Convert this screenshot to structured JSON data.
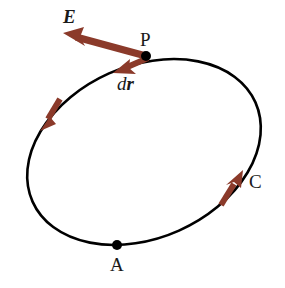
{
  "figure": {
    "type": "physics-line-integral-diagram",
    "background_color": "#ffffff",
    "curve": {
      "name": "closed-loop-path",
      "shape": "ellipse",
      "stroke_color": "#000000",
      "stroke_width": 2.6,
      "center_x": 144,
      "center_y": 152,
      "radius_x": 122,
      "radius_y": 86,
      "rotation_deg": -24
    },
    "points": [
      {
        "id": "P",
        "label": "P",
        "x": 146,
        "y": 56,
        "dot_radius": 5,
        "dot_color": "#000000",
        "label_x": 140,
        "label_y": 30
      },
      {
        "id": "A",
        "label": "A",
        "x": 117,
        "y": 245,
        "dot_radius": 5,
        "dot_color": "#000000",
        "label_x": 110,
        "label_y": 255
      }
    ],
    "vectors": [
      {
        "id": "E",
        "label": "E",
        "label_style": "bold-italic",
        "description": "electric field vector at point P",
        "color": "#8B3A2A",
        "from_x": 146,
        "from_y": 56,
        "to_x": 63,
        "to_y": 33,
        "shaft_width": 7,
        "head_length": 20,
        "head_width": 20,
        "label_x": 63,
        "label_y": 7
      },
      {
        "id": "dr",
        "label_d": "d",
        "label_r": "r",
        "label_style": "italic with bold-italic vector r",
        "description": "differential displacement vector tangent to path at P",
        "color": "#8B3A2A",
        "from_x": 148,
        "from_y": 58,
        "to_x": 113,
        "to_y": 73,
        "shaft_width": 6,
        "head_length": 17,
        "head_width": 17,
        "label_x": 117,
        "label_y": 74
      }
    ],
    "direction_arrows": [
      {
        "id": "direction-arrow-left",
        "description": "path direction indicator on left side of loop, pointing down-left",
        "color": "#8B3A2A",
        "from_x": 59,
        "from_y": 100,
        "to_x": 41,
        "to_y": 130,
        "shaft_width": 6,
        "head_length": 18,
        "head_width": 18
      },
      {
        "id": "direction-arrow-right",
        "description": "path direction indicator on right side of loop near C, pointing up-right",
        "color": "#8B3A2A",
        "from_x": 222,
        "from_y": 204,
        "to_x": 242,
        "to_y": 171,
        "shaft_width": 6,
        "head_length": 18,
        "head_width": 18
      }
    ],
    "labels": {
      "E": "E",
      "P": "P",
      "d": "d",
      "r": "r",
      "C": "C",
      "A": "A"
    }
  }
}
